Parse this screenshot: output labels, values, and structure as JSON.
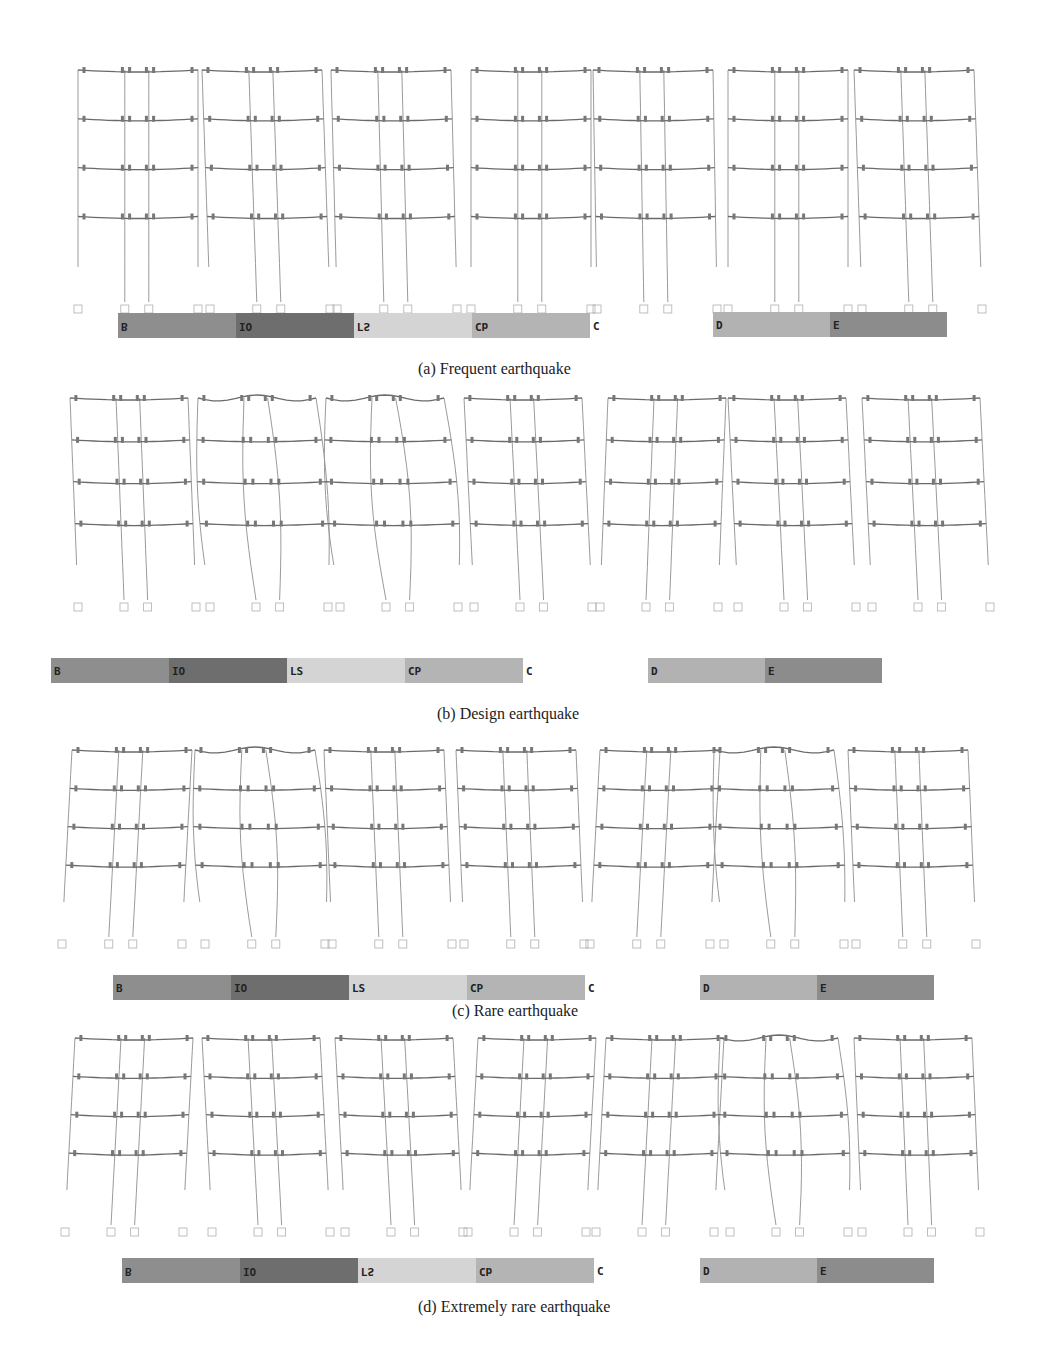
{
  "figure": {
    "panels": [
      {
        "id": "a",
        "caption": "(a) Frequent earthquake",
        "top": 40,
        "frame_top": 22,
        "frame_height": 260,
        "frames_x": [
          78,
          210,
          337,
          471,
          597,
          728,
          862
        ],
        "frame_width": 120,
        "drift": [
          0,
          -8,
          -6,
          0,
          -4,
          0,
          -8
        ],
        "curvature": [
          0,
          0,
          0,
          0,
          0,
          0,
          0
        ],
        "legend": {
          "x": 118,
          "y": 273,
          "flipped": true,
          "labels": [
            "B",
            "IO",
            "LS",
            "CP",
            "C"
          ],
          "labels_rendered": [
            "B",
            "IO",
            "ΓS",
            "Cb",
            "C"
          ]
        },
        "legend2": {
          "x": 713,
          "y": 272,
          "labels": [
            "D",
            "E"
          ]
        },
        "caption_x": 418,
        "caption_y": 320
      },
      {
        "id": "b",
        "caption": "(b) Design earthquake",
        "top": 385,
        "frame_top": 5,
        "frame_height": 230,
        "frames_x": [
          78,
          210,
          340,
          474,
          600,
          738,
          872
        ],
        "frame_width": 118,
        "drift": [
          -8,
          -12,
          -14,
          -10,
          8,
          -10,
          -10
        ],
        "curvature": [
          0,
          10,
          12,
          0,
          0,
          0,
          0
        ],
        "legend": {
          "x": 51,
          "y": 273,
          "flipped": false,
          "labels": [
            "B",
            "IO",
            "LS",
            "CP",
            "C"
          ],
          "labels_rendered": [
            "B",
            "IO",
            "LS",
            "CP",
            "C"
          ]
        },
        "legend2": {
          "x": 648,
          "y": 273,
          "labels": [
            "D",
            "E"
          ]
        },
        "caption_x": 437,
        "caption_y": 320
      },
      {
        "id": "c",
        "caption": "(c) Rare earthquake",
        "top": 742,
        "frame_top": 0,
        "frame_height": 215,
        "frames_x": [
          62,
          205,
          332,
          464,
          590,
          724,
          856
        ],
        "frame_width": 120,
        "drift": [
          10,
          -10,
          -8,
          -8,
          10,
          -10,
          -8
        ],
        "curvature": [
          0,
          10,
          0,
          0,
          0,
          8,
          0
        ],
        "legend": {
          "x": 113,
          "y": 233,
          "flipped": false,
          "labels": [
            "B",
            "IO",
            "LS",
            "CP",
            "C"
          ],
          "labels_rendered": [
            "B",
            "IO",
            "LS",
            "CP",
            "C"
          ]
        },
        "legend2": {
          "x": 700,
          "y": 233,
          "labels": [
            "D",
            "E"
          ]
        },
        "caption_x": 452,
        "caption_y": 260
      },
      {
        "id": "d",
        "caption": "(d) Extremely rare earthquake",
        "top": 1030,
        "frame_top": 0,
        "frame_height": 215,
        "frames_x": [
          65,
          212,
          345,
          468,
          596,
          730,
          862
        ],
        "frame_width": 118,
        "drift": [
          10,
          -10,
          -10,
          10,
          10,
          -10,
          -8
        ],
        "curvature": [
          0,
          0,
          0,
          0,
          0,
          10,
          0
        ],
        "legend": {
          "x": 122,
          "y": 228,
          "flipped": true,
          "labels": [
            "B",
            "IO",
            "LS",
            "CP",
            "C"
          ],
          "labels_rendered": [
            "B",
            "IO",
            "ΓS",
            "Cb",
            "C"
          ]
        },
        "legend2": {
          "x": 700,
          "y": 228,
          "labels": [
            "D",
            "E"
          ]
        },
        "caption_x": 418,
        "caption_y": 268
      }
    ],
    "legend_colors": {
      "B": "#8e8e8e",
      "IO": "#6e6e6e",
      "LS": "#d4d4d4",
      "CP": "#b4b4b4",
      "D": "#b2b2b2",
      "E": "#8c8c8c"
    },
    "line_colors": {
      "beam": "#6a6a6a",
      "column": "#9a9a9a",
      "hinge": "#777777",
      "support": "#b0b0b0"
    },
    "stories": 4,
    "bays": 3
  }
}
